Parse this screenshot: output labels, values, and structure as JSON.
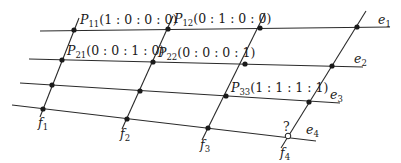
{
  "diagram": {
    "type": "projective-grid",
    "colors": {
      "line": "#2a2a2a",
      "point": "#1a1a1a",
      "background": "#ffffff"
    },
    "e_lines": [
      {
        "name": "e",
        "index": "1",
        "x1": 40,
        "y1": 31,
        "x2": 390,
        "y2": 27,
        "lx": 378,
        "ly": 24
      },
      {
        "name": "e",
        "index": "2",
        "x1": 29,
        "y1": 59,
        "x2": 363,
        "y2": 67,
        "lx": 354,
        "ly": 63
      },
      {
        "name": "e",
        "index": "3",
        "x1": 20,
        "y1": 83,
        "x2": 340,
        "y2": 103,
        "lx": 330,
        "ly": 99
      },
      {
        "name": "e",
        "index": "4",
        "x1": 12,
        "y1": 105,
        "x2": 316,
        "y2": 141,
        "lx": 306,
        "ly": 134
      }
    ],
    "f_lines": [
      {
        "name": "f",
        "index": "1",
        "x1": 79,
        "y1": 18,
        "x2": 40,
        "y2": 117,
        "lx": 38,
        "ly": 127
      },
      {
        "name": "f",
        "index": "2",
        "x1": 173,
        "y1": 16,
        "x2": 122,
        "y2": 129,
        "lx": 120,
        "ly": 138
      },
      {
        "name": "f",
        "index": "3",
        "x1": 265,
        "y1": 13,
        "x2": 202,
        "y2": 140,
        "lx": 200,
        "ly": 149
      },
      {
        "name": "f",
        "index": "4",
        "x1": 366,
        "y1": 11,
        "x2": 281,
        "y2": 148,
        "lx": 280,
        "ly": 157
      }
    ],
    "points": [
      {
        "id": "P11",
        "x": 74,
        "y": 30,
        "filled": true
      },
      {
        "id": "P12",
        "x": 168,
        "y": 29,
        "filled": true
      },
      {
        "id": "e1f3",
        "x": 260,
        "y": 28,
        "filled": true
      },
      {
        "id": "e1f4",
        "x": 357,
        "y": 27,
        "filled": true
      },
      {
        "id": "P21",
        "x": 62,
        "y": 60,
        "filled": true
      },
      {
        "id": "P22",
        "x": 153,
        "y": 62,
        "filled": true
      },
      {
        "id": "e2f3",
        "x": 245,
        "y": 64,
        "filled": true
      },
      {
        "id": "e2f4",
        "x": 332,
        "y": 66,
        "filled": true
      },
      {
        "id": "e3f1",
        "x": 52,
        "y": 85,
        "filled": true
      },
      {
        "id": "e3f2",
        "x": 140,
        "y": 91,
        "filled": true
      },
      {
        "id": "P33",
        "x": 226,
        "y": 96,
        "filled": true
      },
      {
        "id": "e3f4",
        "x": 309,
        "y": 102,
        "filled": true
      },
      {
        "id": "e4f1",
        "x": 43,
        "y": 109,
        "filled": true
      },
      {
        "id": "e4f2",
        "x": 127,
        "y": 119,
        "filled": true
      },
      {
        "id": "e4f3",
        "x": 208,
        "y": 128,
        "filled": true
      },
      {
        "id": "unknown",
        "x": 288,
        "y": 136,
        "filled": false
      }
    ],
    "point_labels": [
      {
        "id": "P11",
        "letter": "P",
        "sub": "11",
        "coords": "(1 : 0 : 0 : 0)",
        "x": 80,
        "y": 24
      },
      {
        "id": "P12",
        "letter": "P",
        "sub": "12",
        "coords": "(0 : 1 : 0 : 0)",
        "x": 174,
        "y": 23
      },
      {
        "id": "P21",
        "letter": "P",
        "sub": "21",
        "coords": "(0 : 0 : 1 : 0)",
        "x": 67,
        "y": 55
      },
      {
        "id": "P22",
        "letter": "P",
        "sub": "22",
        "coords": "(0 : 0 : 0 : 1)",
        "x": 158,
        "y": 57
      },
      {
        "id": "P33",
        "letter": "P",
        "sub": "33",
        "coords": "(1 : 1 : 1 : 1)",
        "x": 231,
        "y": 92
      }
    ],
    "unknown_label": {
      "text": "?",
      "x": 283,
      "y": 131
    }
  }
}
